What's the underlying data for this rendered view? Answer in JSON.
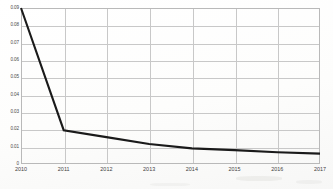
{
  "chart_data": {
    "type": "line",
    "title": "",
    "subtitle": "",
    "xlabel": "",
    "ylabel": "",
    "x": [
      "2010",
      "2011",
      "2012",
      "2013",
      "2014",
      "2015",
      "2016",
      "2017"
    ],
    "categories": [
      "2010",
      "2011",
      "2012",
      "2013",
      "2014",
      "2015",
      "2016",
      "2017"
    ],
    "values": [
      0.09,
      0.0195,
      0.0155,
      0.0115,
      0.009,
      0.008,
      0.0068,
      0.006
    ],
    "series": [
      {
        "name": "",
        "values": [
          0.09,
          0.0195,
          0.0155,
          0.0115,
          0.009,
          0.008,
          0.0068,
          0.006
        ]
      }
    ],
    "xlim": [
      "2010",
      "2017"
    ],
    "ylim": [
      0,
      0.09
    ],
    "ytick_labels": [
      "0",
      "0.01",
      "0.02",
      "0.03",
      "0.04",
      "0.05",
      "0.06",
      "0.07",
      "0.08",
      "0.09"
    ],
    "ytick_values": [
      0,
      0.01,
      0.02,
      0.03,
      0.04,
      0.05,
      0.06,
      0.07,
      0.08,
      0.09
    ],
    "xtick_labels": [
      "2010",
      "2011",
      "2012",
      "2013",
      "2014",
      "2015",
      "2016",
      "2017"
    ],
    "grid": true,
    "grid_axes": "both",
    "legend": false,
    "legend_position": "none",
    "annotations": [],
    "line_color": "#1a1a1a",
    "grid_color": "#c8c8c8",
    "frame_color": "#b9b9b9",
    "background_color": "#fdfdfd"
  }
}
